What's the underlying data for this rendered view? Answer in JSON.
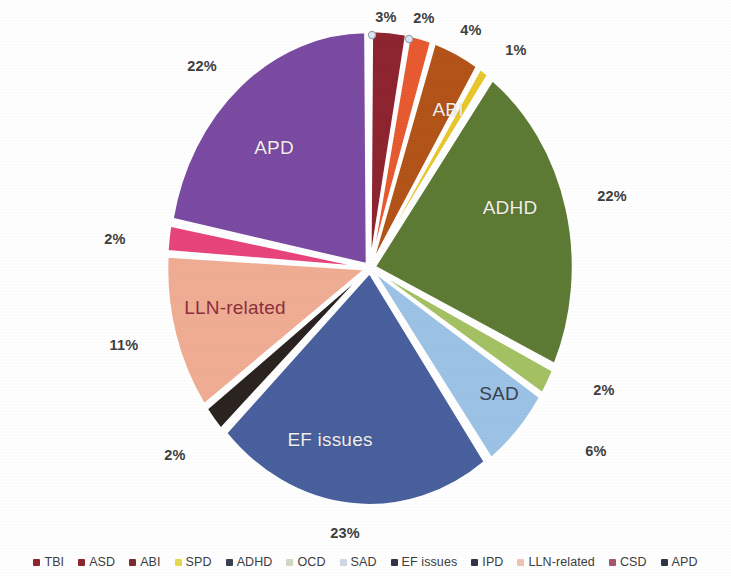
{
  "chart_data": {
    "type": "pie",
    "title": "",
    "subtitle": "",
    "xlabel": "",
    "ylabel": "",
    "legend_position": "bottom",
    "grid": false,
    "units": "percent",
    "categories": [
      "TBI",
      "ASD",
      "ABI",
      "SPD",
      "ADHD",
      "OCD",
      "SAD",
      "EF issues",
      "IPD",
      "LLN-related",
      "CSD",
      "APD"
    ],
    "values": [
      3,
      2,
      4,
      1,
      22,
      2,
      6,
      23,
      2,
      11,
      2,
      22
    ],
    "slices": [
      {
        "name": "TBI",
        "value": 3,
        "pct_label": "3%",
        "color": "#8e2430",
        "inside_label": "",
        "label_x": 386,
        "label_y": 17,
        "has_leader_dot": true,
        "dot_x": 372,
        "dot_y": 35
      },
      {
        "name": "ASD",
        "value": 2,
        "pct_label": "2%",
        "color": "#e85a30",
        "inside_label": "",
        "label_x": 424,
        "label_y": 18,
        "has_leader_dot": true,
        "dot_x": 409,
        "dot_y": 39
      },
      {
        "name": "ABI",
        "value": 4,
        "pct_label": "4%",
        "color": "#b35419",
        "inside_label": "ABI",
        "label_x": 471,
        "label_y": 30,
        "has_leader_dot": false
      },
      {
        "name": "SPD",
        "value": 1,
        "pct_label": "1%",
        "color": "#e8c72c",
        "inside_label": "",
        "label_x": 516,
        "label_y": 50,
        "has_leader_dot": false
      },
      {
        "name": "ADHD",
        "value": 22,
        "pct_label": "22%",
        "color": "#5d7b34",
        "inside_label": "ADHD",
        "label_x": 612,
        "label_y": 196,
        "has_leader_dot": false
      },
      {
        "name": "OCD",
        "value": 2,
        "pct_label": "2%",
        "color": "#a4c163",
        "inside_label": "",
        "label_x": 604,
        "label_y": 390,
        "has_leader_dot": false
      },
      {
        "name": "SAD",
        "value": 6,
        "pct_label": "6%",
        "color": "#9cc3e6",
        "inside_label": "SAD",
        "label_x": 596,
        "label_y": 451,
        "has_leader_dot": false
      },
      {
        "name": "EF issues",
        "value": 23,
        "pct_label": "23%",
        "color": "#49609e",
        "inside_label": "EF issues",
        "label_x": 345,
        "label_y": 533,
        "has_leader_dot": false
      },
      {
        "name": "IPD",
        "value": 2,
        "pct_label": "2%",
        "color": "#2b2320",
        "inside_label": "",
        "label_x": 175,
        "label_y": 455,
        "has_leader_dot": false
      },
      {
        "name": "LLN-related",
        "value": 11,
        "pct_label": "11%",
        "color": "#f0ad94",
        "inside_label": "LLN-related",
        "label_x": 124,
        "label_y": 345,
        "has_leader_dot": false
      },
      {
        "name": "CSD",
        "value": 2,
        "pct_label": "2%",
        "color": "#e8447c",
        "inside_label": "",
        "label_x": 115,
        "label_y": 239,
        "has_leader_dot": false
      },
      {
        "name": "APD",
        "value": 22,
        "pct_label": "22%",
        "color": "#7b4ba3",
        "inside_label": "APD",
        "label_x": 202,
        "label_y": 66,
        "has_leader_dot": false
      }
    ],
    "inside_label_positions": {
      "ABI": {
        "x": 448,
        "y": 110
      },
      "ADHD": {
        "x": 510,
        "y": 208
      },
      "SAD": {
        "x": 499,
        "y": 394
      },
      "EF issues": {
        "x": 330,
        "y": 440
      },
      "LLN-related": {
        "x": 235,
        "y": 308
      },
      "APD": {
        "x": 274,
        "y": 148
      }
    },
    "legend": [
      {
        "label": "TBI",
        "color": "#8e2430"
      },
      {
        "label": "ASD",
        "color": "#8e2430"
      },
      {
        "label": "ABI",
        "color": "#7a2b30"
      },
      {
        "label": "SPD",
        "color": "#e8d84c"
      },
      {
        "label": "ADHD",
        "color": "#3a3f52"
      },
      {
        "label": "OCD",
        "color": "#cfd9c4"
      },
      {
        "label": "SAD",
        "color": "#cfd9e6"
      },
      {
        "label": "EF issues",
        "color": "#2f3446"
      },
      {
        "label": "IPD",
        "color": "#2f3446"
      },
      {
        "label": "LLN-related",
        "color": "#f0c4b4"
      },
      {
        "label": "CSD",
        "color": "#a8566e"
      },
      {
        "label": "APD",
        "color": "#2f3446"
      }
    ]
  }
}
